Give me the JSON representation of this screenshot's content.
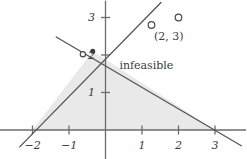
{
  "figure": {
    "name": "feasible-region-plot",
    "background": "#ffffff",
    "ink_color": "#555555",
    "shade_color": "#e9e9e9",
    "axis_color": "#6b6b6b"
  },
  "geometry": {
    "origin_px": {
      "x": 105.5,
      "y": 130
    },
    "unit_px": {
      "x": 36.5,
      "y": 37.5
    }
  },
  "chart_data": {
    "type": "scatter",
    "title": "",
    "xlabel": "",
    "ylabel": "",
    "xlim": [
      -2.9,
      3.85
    ],
    "ylim": [
      -0.78,
      3.45
    ],
    "grid": false,
    "legend": null,
    "x_ticks": [
      -2,
      -1,
      1,
      2,
      3
    ],
    "x_tick_labels": [
      "−2",
      "−1",
      "1",
      "2",
      "3"
    ],
    "y_ticks": [
      1,
      2,
      3
    ],
    "y_tick_labels": [
      "1",
      "2",
      "3"
    ],
    "shaded_region": {
      "name": "feasible-region",
      "label": "",
      "fill": "#e9e9e9",
      "vertices": [
        [
          -2,
          0
        ],
        [
          3,
          0
        ],
        [
          -0.35,
          2.1
        ]
      ]
    },
    "lines": [
      {
        "name": "constraint-line-rising",
        "from": [
          -2.35,
          -0.45
        ],
        "to": [
          1.52,
          3.4
        ]
      },
      {
        "name": "constraint-line-falling",
        "from": [
          -1.35,
          2.48
        ],
        "to": [
          3.72,
          -0.42
        ]
      }
    ],
    "points": [
      {
        "name": "open-point-vertex",
        "x": -0.62,
        "y": 2.02,
        "marker": "open-circle",
        "label": ""
      },
      {
        "name": "filled-point-vertex",
        "x": -0.35,
        "y": 2.1,
        "marker": "filled-dot",
        "label": ""
      },
      {
        "name": "open-point-left",
        "x": 1.26,
        "y": 2.8,
        "marker": "open-circle",
        "label": ""
      },
      {
        "name": "open-point-right",
        "x": 2.0,
        "y": 3.0,
        "marker": "open-circle",
        "label": "(2, 3)"
      }
    ],
    "annotations": [
      {
        "name": "infeasible-label",
        "text": "infeasible",
        "x": 1.12,
        "y": 1.72
      },
      {
        "name": "point-coord-label",
        "text": "(2, 3)",
        "x": 1.74,
        "y": 2.5
      }
    ]
  }
}
